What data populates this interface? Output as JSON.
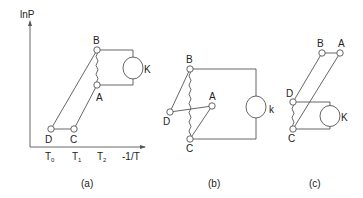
{
  "figure": {
    "panel_a": {
      "caption": "(a)",
      "y_axis_label": "lnP",
      "x_axis_label": "-1/T",
      "x_ticks": [
        "T0",
        "T1",
        "T2"
      ],
      "x_tick_main": [
        "T",
        "T",
        "T"
      ],
      "x_tick_sub": [
        "0",
        "1",
        "2"
      ],
      "nodes": {
        "A": "A",
        "B": "B",
        "C": "C",
        "D": "D"
      },
      "compressor_label": "K"
    },
    "panel_b": {
      "caption": "(b)",
      "nodes": {
        "A": "A",
        "B": "B",
        "C": "C",
        "D": "D"
      },
      "compressor_label": "k"
    },
    "panel_c": {
      "caption": "(c)",
      "nodes": {
        "A": "A",
        "B": "B",
        "C": "C",
        "D": "D"
      },
      "compressor_label": "K"
    }
  }
}
